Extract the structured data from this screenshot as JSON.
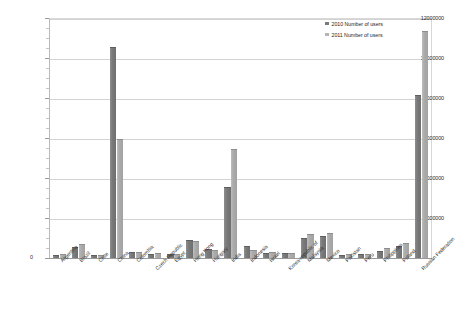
{
  "chart_data": {
    "type": "bar",
    "title": "",
    "xlabel": "",
    "ylabel": "",
    "ylim": [
      0,
      12000000
    ],
    "y_ticks": [
      0,
      2000000,
      4000000,
      6000000,
      8000000,
      10000000,
      12000000
    ],
    "y_tick_labels": [
      "0",
      "2000000",
      "4000000",
      "6000000",
      "8000000",
      "10000000",
      "12000000"
    ],
    "y_minor_tick_step": 500000,
    "grid": true,
    "legend_position": "top-right",
    "categories": [
      "Argentina",
      "Brazil",
      "Chile",
      "China",
      "Colombia",
      "Czech Republic",
      "Egypt",
      "Hong Kong",
      "Hungary",
      "India",
      "Indonesia",
      "Israel",
      "Korea-republic of",
      "Malaysia",
      "Mexico",
      "Pakistan",
      "Peru",
      "Philippines",
      "Poland",
      "Russian Federation"
    ],
    "series": [
      {
        "name": "2010 Number of users",
        "color": "#7a7a7a",
        "values": [
          120000,
          500000,
          90000,
          10500000,
          230000,
          160000,
          130000,
          850000,
          420000,
          3500000,
          560000,
          220000,
          180000,
          950000,
          1050000,
          110000,
          130000,
          300000,
          560000,
          8100000
        ]
      },
      {
        "name": "2011 Number of users",
        "color": "#b5b5b5",
        "values": [
          160000,
          650000,
          110000,
          5900000,
          270000,
          200000,
          150000,
          800000,
          330000,
          5400000,
          330000,
          260000,
          210000,
          1150000,
          1180000,
          150000,
          170000,
          430000,
          700000,
          11300000
        ]
      }
    ]
  },
  "legend": {
    "items": [
      {
        "label": "2010 Number of users"
      },
      {
        "label": "2011 Number of users"
      }
    ]
  }
}
